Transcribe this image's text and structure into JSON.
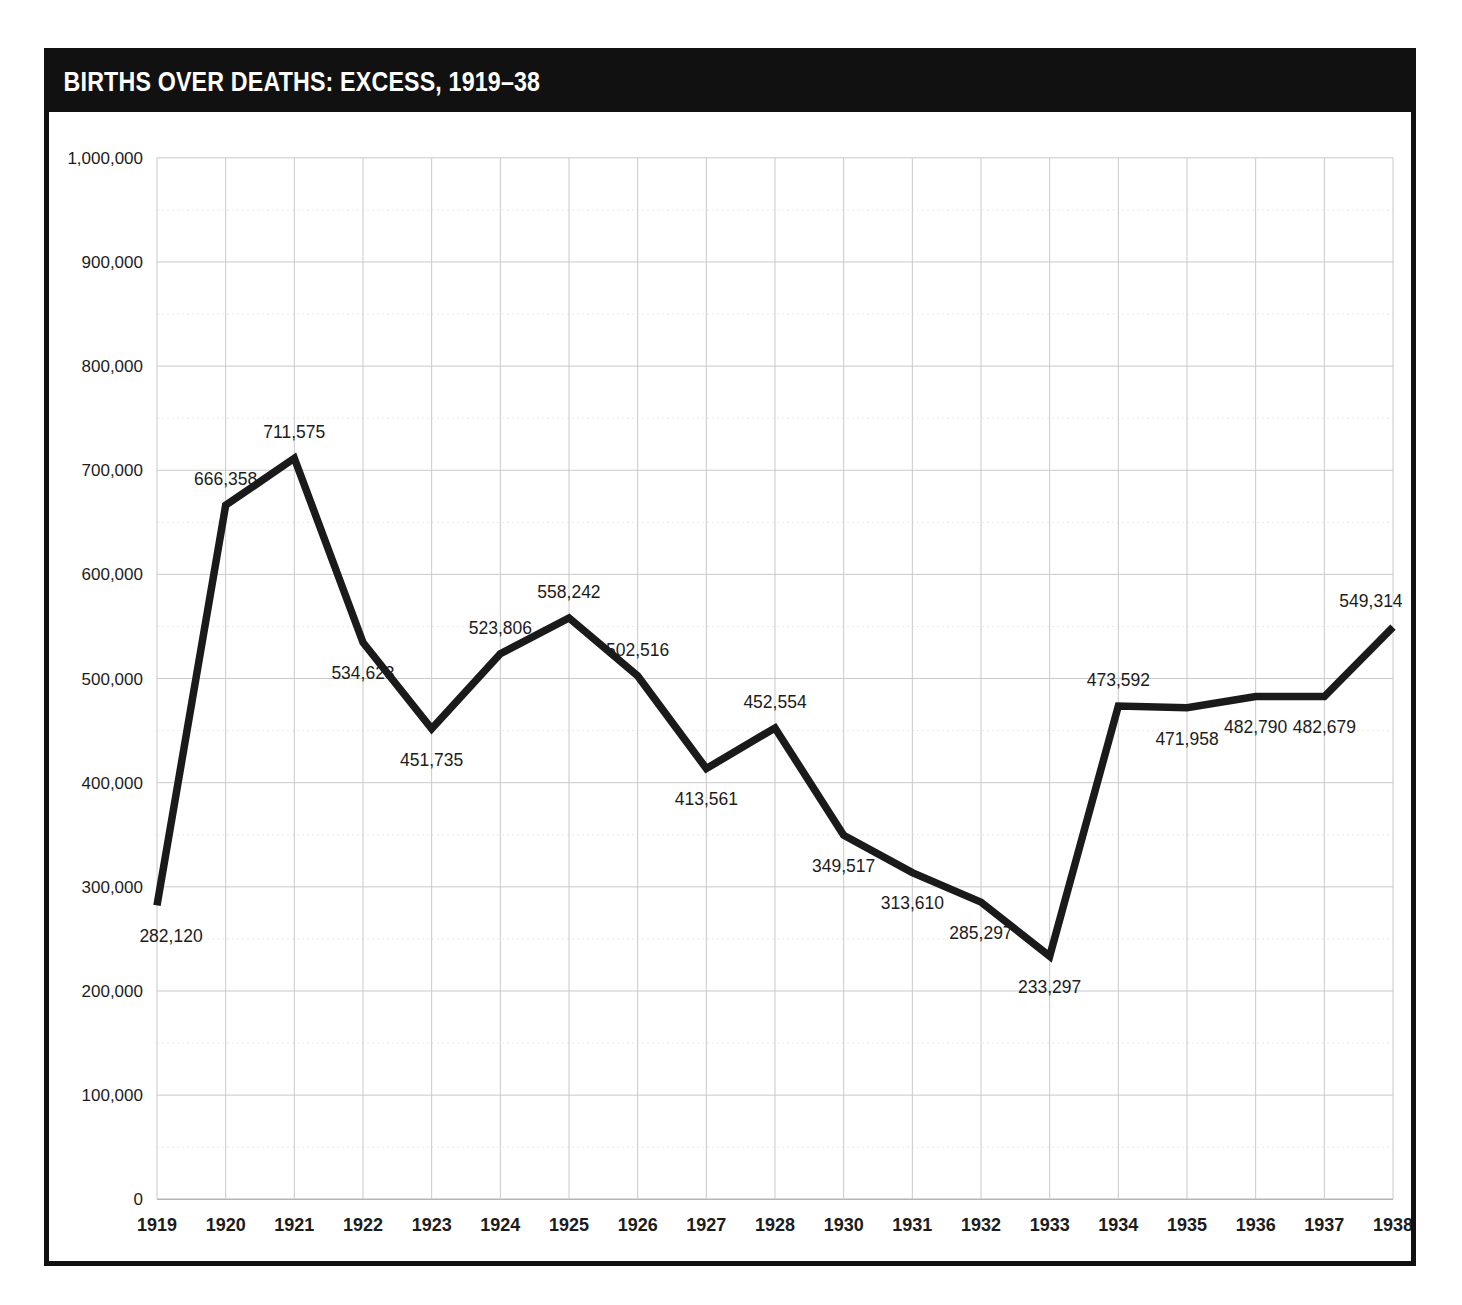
{
  "title": "BIRTHS OVER DEATHS: EXCESS, 1919–38",
  "colors": {
    "title_bar_bg": "#111111",
    "title_text": "#ffffff",
    "frame_border": "#111111",
    "line": "#1a1a1a",
    "grid_major": "#c9c9c9",
    "grid_minor": "#e9e9e9",
    "label_text": "#1c1c1c",
    "page_bg": "#ffffff"
  },
  "chart_data": {
    "type": "line",
    "title": "BIRTHS OVER DEATHS: EXCESS, 1919–38",
    "xlabel": "",
    "ylabel": "",
    "categories": [
      "1919",
      "1920",
      "1921",
      "1922",
      "1923",
      "1924",
      "1925",
      "1926",
      "1927",
      "1928",
      "1930",
      "1931",
      "1932",
      "1933",
      "1934",
      "1935",
      "1936",
      "1937",
      "1938"
    ],
    "values": [
      282120,
      666358,
      711575,
      534623,
      451735,
      523806,
      558242,
      502516,
      413561,
      452554,
      349517,
      313610,
      285297,
      233297,
      473592,
      471958,
      482790,
      482679,
      549314
    ],
    "point_labels": [
      "282,120",
      "666,358",
      "711,575",
      "534,623",
      "451,735",
      "523,806",
      "558,242",
      "502,516",
      "413,561",
      "452,554",
      "349,517",
      "313,610",
      "285,297",
      "233,297",
      "473,592",
      "471,958",
      "482,790",
      "482,679",
      "549,314"
    ],
    "label_positions": [
      "below",
      "above",
      "above",
      "below",
      "below",
      "above",
      "above",
      "above",
      "below",
      "above",
      "below",
      "below",
      "below",
      "below",
      "above",
      "below",
      "below",
      "below",
      "above"
    ],
    "ylim": [
      0,
      1000000
    ],
    "ytick_values": [
      0,
      100000,
      200000,
      300000,
      400000,
      500000,
      600000,
      700000,
      800000,
      900000,
      1000000
    ],
    "ytick_labels": [
      "0",
      "100,000",
      "200,000",
      "300,000",
      "400,000",
      "500,000",
      "600,000",
      "700,000",
      "800,000",
      "900,000",
      "1,000,000"
    ],
    "minor_ytick_values": [
      50000,
      150000,
      250000,
      350000,
      450000,
      550000,
      650000,
      750000,
      850000,
      950000
    ],
    "grid": true,
    "legend": "none",
    "series": [
      {
        "name": "Excess of births over deaths",
        "values": [
          282120,
          666358,
          711575,
          534623,
          451735,
          523806,
          558242,
          502516,
          413561,
          452554,
          349517,
          313610,
          285297,
          233297,
          473592,
          471958,
          482790,
          482679,
          549314
        ]
      }
    ]
  }
}
